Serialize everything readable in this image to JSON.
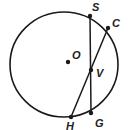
{
  "diagram": {
    "colors": {
      "stroke": "#1a1a1a",
      "background": "#ffffff"
    },
    "circle": {
      "center_label": "O",
      "cx": 64,
      "cy": 64.5,
      "rx": 54,
      "ry": 52.5
    },
    "points": {
      "O": {
        "label": "O",
        "x": 68,
        "y": 62,
        "lx": 72,
        "ly": 59
      },
      "S": {
        "label": "S",
        "x": 90,
        "y": 16,
        "lx": 92,
        "ly": 10
      },
      "C": {
        "label": "C",
        "x": 108,
        "y": 28,
        "lx": 112,
        "ly": 26
      },
      "V": {
        "label": "V",
        "x": 91,
        "y": 70,
        "lx": 96,
        "ly": 76
      },
      "G": {
        "label": "G",
        "x": 91,
        "y": 113,
        "lx": 95,
        "ly": 126
      },
      "H": {
        "label": "H",
        "x": 71,
        "y": 117,
        "lx": 67,
        "ly": 129
      }
    },
    "chords": [
      {
        "name": "SG",
        "from": "S",
        "to": "G"
      },
      {
        "name": "CH",
        "from": "C",
        "to": "H"
      }
    ]
  }
}
